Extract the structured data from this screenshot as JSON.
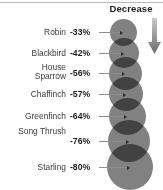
{
  "header": {
    "column_label": "Decrease"
  },
  "icons": {
    "down_arrow": "arrow-down-icon"
  },
  "colors": {
    "bubble": "#6f6f6f",
    "arrow": "#7a7a7a",
    "text": "#1b1b1b",
    "label": "#3a3a3a",
    "leader": "#8d8d8d",
    "rule": "#b9b9b9"
  },
  "chart_data": {
    "type": "bar",
    "title": "",
    "subtitle": "",
    "xlabel": "",
    "ylabel": "",
    "value_column_header": "Decrease",
    "grid": false,
    "legend": false,
    "note": "Proportional-area bubble chart: bubble diameter scales with magnitude of percentage decline",
    "categories": [
      "Robin",
      "Blackbird",
      "House Sparrow",
      "Chaffinch",
      "Greenfinch",
      "Song Thrush",
      "Starling"
    ],
    "values": [
      -33,
      -42,
      -56,
      -57,
      -64,
      -76,
      -80
    ],
    "labels": [
      "-33%",
      "-42%",
      "-56%",
      "-57%",
      "-64%",
      "-76%",
      "-80%"
    ],
    "ylim": [
      -100,
      0
    ]
  },
  "rows": [
    {
      "name": "Robin",
      "name_line1": "Robin",
      "name_line2": "",
      "value": "-33%",
      "bubble_d": 27,
      "cx": 123,
      "cy": 32,
      "name_top": 27,
      "leader_y": 32,
      "leader_x": 99,
      "leader_w": 21
    },
    {
      "name": "Blackbird",
      "name_line1": "Blackbird",
      "name_line2": "",
      "value": "-42%",
      "bubble_d": 30,
      "cx": 124,
      "cy": 53,
      "name_top": 48,
      "leader_y": 53,
      "leader_x": 99,
      "leader_w": 22
    },
    {
      "name": "House Sparrow",
      "name_line1": "House",
      "name_line2": "Sparrow",
      "value": "-56%",
      "bubble_d": 33,
      "cx": 125,
      "cy": 73,
      "name_top": 63,
      "leader_y": 73,
      "leader_x": 99,
      "leader_w": 23
    },
    {
      "name": "Chaffinch",
      "name_line1": "Chaffinch",
      "name_line2": "",
      "value": "-57%",
      "bubble_d": 34,
      "cx": 126,
      "cy": 94,
      "name_top": 89,
      "leader_y": 94,
      "leader_x": 99,
      "leader_w": 24
    },
    {
      "name": "Greenfinch",
      "name_line1": "Greenfinch",
      "name_line2": "",
      "value": "-64%",
      "bubble_d": 37,
      "cx": 127,
      "cy": 116,
      "name_top": 111,
      "leader_y": 116,
      "leader_x": 99,
      "leader_w": 25
    },
    {
      "name": "Song Thrush",
      "name_line1": "Song Thrush",
      "name_line2": "",
      "value": "-76%",
      "bubble_d": 42,
      "cx": 129,
      "cy": 141,
      "name_top": 126,
      "leader_y": 141,
      "leader_x": 99,
      "leader_w": 27
    },
    {
      "name": "Starling",
      "name_line1": "Starling",
      "name_line2": "",
      "value": "-80%",
      "bubble_d": 46,
      "cx": 130,
      "cy": 167,
      "name_top": 162,
      "leader_y": 167,
      "leader_x": 99,
      "leader_w": 28
    }
  ]
}
